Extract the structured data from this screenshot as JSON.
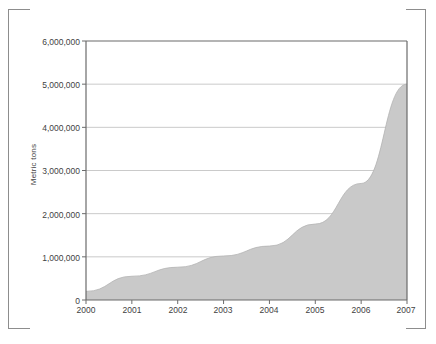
{
  "chart_data": {
    "type": "area",
    "title": "",
    "subtitle": "",
    "xlabel": "",
    "ylabel": "Metric tons",
    "categories": [
      "2000",
      "2001",
      "2002",
      "2003",
      "2004",
      "2005",
      "2006",
      "2007"
    ],
    "x": [
      2000,
      2001,
      2002,
      2003,
      2004,
      2005,
      2006,
      2007
    ],
    "values": [
      200000,
      550000,
      760000,
      1020000,
      1250000,
      1760000,
      2700000,
      5000000
    ],
    "series": [
      {
        "name": "Metric tons",
        "values": [
          200000,
          550000,
          760000,
          1020000,
          1250000,
          1760000,
          2700000,
          5000000
        ]
      }
    ],
    "xlim": [
      2000,
      2007
    ],
    "ylim": [
      0,
      6000000
    ],
    "ytick_labels": [
      "0",
      "1,000,000",
      "2,000,000",
      "3,000,000",
      "4,000,000",
      "5,000,000",
      "6,000,000"
    ],
    "ytick_values": [
      0,
      1000000,
      2000000,
      3000000,
      4000000,
      5000000,
      6000000
    ],
    "xtick_labels": [
      "2000",
      "2001",
      "2002",
      "2003",
      "2004",
      "2005",
      "2006",
      "2007"
    ],
    "grid": "horizontal",
    "legend": "none",
    "colors": {
      "area_fill": "#c9c9c9",
      "axis_line": "#6b6b6b",
      "grid_line": "#bdbdbd",
      "text": "#3f3f3f",
      "frame": "#8d8d8d",
      "background": "#ffffff"
    }
  }
}
